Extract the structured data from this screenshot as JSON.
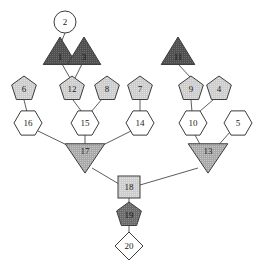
{
  "diagram": {
    "background_color": "#ffffff",
    "edge_color": "#4a4a4a",
    "stroke_color": "#3c3c3c",
    "fills": {
      "white": "#ffffff",
      "light_gray": "#d4d4d4",
      "mid_gray": "#b5b5b5",
      "dark_gray": "#6b6b6b",
      "darker_gray": "#595959"
    },
    "node_count": 20,
    "edge_count": 19
  },
  "nodes": [
    {
      "id": "n2",
      "label": "2",
      "shape": "circle",
      "fill": "white",
      "cx": 65,
      "cy": 22,
      "r": 11
    },
    {
      "id": "n1",
      "label": "1",
      "shape": "triangle-up",
      "fill": "darker_gray",
      "cx": 60,
      "cy": 53,
      "r": 16
    },
    {
      "id": "n3",
      "label": "3",
      "shape": "triangle-up",
      "fill": "darker_gray",
      "cx": 84,
      "cy": 53,
      "r": 16
    },
    {
      "id": "n11",
      "label": "11",
      "shape": "triangle-up",
      "fill": "darker_gray",
      "cx": 178,
      "cy": 53,
      "r": 16
    },
    {
      "id": "n6",
      "label": "6",
      "shape": "pentagon",
      "fill": "light_gray",
      "cx": 24,
      "cy": 89,
      "r": 13
    },
    {
      "id": "n12",
      "label": "12",
      "shape": "pentagon",
      "fill": "light_gray",
      "cx": 72,
      "cy": 89,
      "r": 13
    },
    {
      "id": "n8",
      "label": "8",
      "shape": "pentagon",
      "fill": "light_gray",
      "cx": 107,
      "cy": 89,
      "r": 13
    },
    {
      "id": "n7",
      "label": "7",
      "shape": "pentagon",
      "fill": "light_gray",
      "cx": 140,
      "cy": 89,
      "r": 13
    },
    {
      "id": "n9",
      "label": "9",
      "shape": "pentagon",
      "fill": "light_gray",
      "cx": 191,
      "cy": 89,
      "r": 13
    },
    {
      "id": "n4",
      "label": "4",
      "shape": "pentagon",
      "fill": "light_gray",
      "cx": 219,
      "cy": 89,
      "r": 13
    },
    {
      "id": "n16",
      "label": "16",
      "shape": "hexagon",
      "fill": "white",
      "cx": 28,
      "cy": 123,
      "r": 14
    },
    {
      "id": "n15",
      "label": "15",
      "shape": "hexagon",
      "fill": "white",
      "cx": 85,
      "cy": 123,
      "r": 14
    },
    {
      "id": "n14",
      "label": "14",
      "shape": "hexagon",
      "fill": "white",
      "cx": 140,
      "cy": 123,
      "r": 14
    },
    {
      "id": "n10",
      "label": "10",
      "shape": "hexagon",
      "fill": "white",
      "cx": 193,
      "cy": 123,
      "r": 14
    },
    {
      "id": "n5",
      "label": "5",
      "shape": "hexagon",
      "fill": "white",
      "cx": 238,
      "cy": 123,
      "r": 14
    },
    {
      "id": "n17",
      "label": "17",
      "shape": "triangle-down",
      "fill": "mid_gray",
      "cx": 85,
      "cy": 156,
      "r": 18
    },
    {
      "id": "n13",
      "label": "13",
      "shape": "triangle-down",
      "fill": "mid_gray",
      "cx": 208,
      "cy": 156,
      "r": 18
    },
    {
      "id": "n18",
      "label": "18",
      "shape": "square",
      "fill": "light_gray",
      "cx": 129,
      "cy": 187,
      "r": 11
    },
    {
      "id": "n19",
      "label": "19",
      "shape": "pentagon",
      "fill": "dark_gray",
      "cx": 129,
      "cy": 215,
      "r": 13
    },
    {
      "id": "n20",
      "label": "20",
      "shape": "diamond",
      "fill": "white",
      "cx": 129,
      "cy": 246,
      "r": 14
    }
  ],
  "edges": [
    {
      "from": "n2",
      "to": "n1",
      "x1": 65,
      "y1": 33,
      "x2": 60,
      "y2": 45
    },
    {
      "from": "n1",
      "to": "n12",
      "x1": 62,
      "y1": 64,
      "x2": 70,
      "y2": 78
    },
    {
      "from": "n3",
      "to": "n12",
      "x1": 82,
      "y1": 64,
      "x2": 75,
      "y2": 78
    },
    {
      "from": "n11",
      "to": "n9",
      "x1": 178,
      "y1": 64,
      "x2": 191,
      "y2": 78
    },
    {
      "from": "n6",
      "to": "n16",
      "x1": 24,
      "y1": 100,
      "x2": 27,
      "y2": 112
    },
    {
      "from": "n12",
      "to": "n15",
      "x1": 73,
      "y1": 100,
      "x2": 82,
      "y2": 112
    },
    {
      "from": "n8",
      "to": "n15",
      "x1": 102,
      "y1": 99,
      "x2": 91,
      "y2": 112
    },
    {
      "from": "n7",
      "to": "n14",
      "x1": 140,
      "y1": 100,
      "x2": 140,
      "y2": 112
    },
    {
      "from": "n9",
      "to": "n10",
      "x1": 191,
      "y1": 100,
      "x2": 192,
      "y2": 112
    },
    {
      "from": "n4",
      "to": "n10",
      "x1": 214,
      "y1": 99,
      "x2": 199,
      "y2": 112
    },
    {
      "from": "n16",
      "to": "n17",
      "x1": 38,
      "y1": 131,
      "x2": 73,
      "y2": 148
    },
    {
      "from": "n15",
      "to": "n17",
      "x1": 85,
      "y1": 135,
      "x2": 85,
      "y2": 148
    },
    {
      "from": "n14",
      "to": "n17",
      "x1": 131,
      "y1": 131,
      "x2": 97,
      "y2": 148
    },
    {
      "from": "n10",
      "to": "n13",
      "x1": 195,
      "y1": 135,
      "x2": 202,
      "y2": 148
    },
    {
      "from": "n5",
      "to": "n13",
      "x1": 230,
      "y1": 132,
      "x2": 216,
      "y2": 148
    },
    {
      "from": "n17",
      "to": "n18",
      "x1": 92,
      "y1": 168,
      "x2": 119,
      "y2": 184
    },
    {
      "from": "n13",
      "to": "n18",
      "x1": 198,
      "y1": 168,
      "x2": 140,
      "y2": 185
    },
    {
      "from": "n18",
      "to": "n19",
      "x1": 129,
      "y1": 198,
      "x2": 129,
      "y2": 205
    },
    {
      "from": "n19",
      "to": "n20",
      "x1": 129,
      "y1": 226,
      "x2": 129,
      "y2": 234
    }
  ]
}
